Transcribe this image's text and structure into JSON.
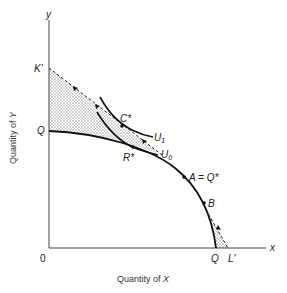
{
  "figure": {
    "type": "economics-diagram",
    "axes": {
      "x_label_short": "x",
      "y_label_short": "y",
      "origin_label": "0",
      "x_title_prefix": "Quantity of ",
      "x_title_var": "X",
      "y_title_prefix": "Quantity of ",
      "y_title_var": "Y"
    },
    "points": {
      "k_prime": "K'",
      "q_y_intercept": "Q",
      "c_star": "C*",
      "r_star": "R*",
      "a_eq_q_star": "A = Q*",
      "b": "B",
      "q_x_intercept": "Q",
      "l_prime": "L'"
    },
    "curves": {
      "u1": "U",
      "u1_sub": "1",
      "u0": "U",
      "u0_sub": "0"
    },
    "colors": {
      "line": "#111111",
      "axis": "#444444",
      "shade": "#bdbdbd"
    }
  }
}
